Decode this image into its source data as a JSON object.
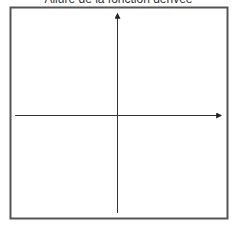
{
  "title": "Allure de la fonction dérivée",
  "diagram": {
    "type": "blank-axes",
    "axes": {
      "x_label": "",
      "y_label": "",
      "x_arrow": true,
      "y_arrow": true
    },
    "colors": {
      "frame": "#555555",
      "axis": "#333333",
      "background": "#ffffff"
    }
  }
}
